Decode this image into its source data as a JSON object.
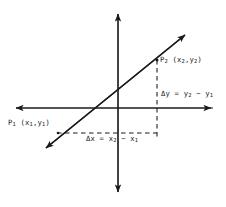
{
  "figure": {
    "background_color": "#ffffff",
    "stroke_color": "#1a1a1a"
  },
  "axes": {
    "origin": {
      "x": 118,
      "y": 108
    },
    "x_axis": {
      "name": "horizontal-axis",
      "from_x": 14,
      "to_x": 213,
      "y": 108,
      "double_headed": true
    },
    "y_axis": {
      "name": "vertical-axis",
      "x": 118,
      "from_y": 12,
      "to_y": 194,
      "double_headed": true
    }
  },
  "line": {
    "name": "secant-line",
    "from": {
      "x": 44,
      "y": 150
    },
    "to": {
      "x": 187,
      "y": 33
    },
    "double_headed": true
  },
  "points": {
    "p1": {
      "label": "P",
      "sub": "1",
      "coords_open": " (x",
      "coords_sub1": "1",
      "coords_mid": ",y",
      "coords_sub2": "1",
      "coords_close": ")",
      "marker": {
        "x": 58,
        "y": 133
      }
    },
    "p2": {
      "label": "P",
      "sub": "2",
      "coords_open": " (x",
      "coords_sub1": "2",
      "coords_mid": ",y",
      "coords_sub2": "2",
      "coords_close": ")",
      "marker": {
        "x": 157,
        "y": 60
      }
    }
  },
  "deltas": {
    "dy": {
      "prefix": "Δy = y",
      "sub1": "2",
      "minus": " − y",
      "sub2": "1",
      "dashed_segment": {
        "x": 157,
        "from_y": 60,
        "to_y": 138
      }
    },
    "dx": {
      "prefix": "Δx = x",
      "sub1": "2",
      "minus": " − x",
      "sub2": "1",
      "dashed_segment": {
        "y": 133,
        "from_x": 58,
        "to_x": 157
      }
    }
  }
}
